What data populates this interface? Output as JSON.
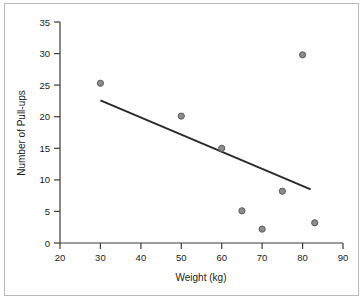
{
  "chart_data": {
    "type": "scatter",
    "title": "",
    "xlabel": "Weight (kg)",
    "ylabel": "Number of Pull-ups",
    "xlim": [
      20,
      90
    ],
    "ylim": [
      0,
      35
    ],
    "xticks": [
      20,
      30,
      40,
      50,
      60,
      70,
      80,
      90
    ],
    "yticks": [
      0,
      5,
      10,
      15,
      20,
      25,
      30,
      35
    ],
    "xtick_labels": [
      "20",
      "30",
      "40",
      "50",
      "60",
      "70",
      "80",
      "90"
    ],
    "ytick_labels": [
      "0",
      "5",
      "10",
      "15",
      "20",
      "25",
      "30",
      "35"
    ],
    "grid": false,
    "legend": null,
    "marker_color": "#8c8c8c",
    "marker_edge_color": "#5a5a5a",
    "line_color": "#2b2b2b",
    "points": [
      {
        "x": 30,
        "y": 25.3
      },
      {
        "x": 50,
        "y": 20.1
      },
      {
        "x": 60,
        "y": 15.0
      },
      {
        "x": 65,
        "y": 5.1
      },
      {
        "x": 70,
        "y": 2.2
      },
      {
        "x": 75,
        "y": 8.2
      },
      {
        "x": 80,
        "y": 29.8
      },
      {
        "x": 83,
        "y": 3.2
      }
    ],
    "series": [
      {
        "name": "Pull-ups vs Weight",
        "x": [
          30,
          50,
          60,
          65,
          70,
          75,
          80,
          83
        ],
        "values": [
          25.3,
          20.1,
          15.0,
          5.1,
          2.2,
          8.2,
          29.8,
          3.2
        ]
      }
    ],
    "trend_line": {
      "type": "line",
      "x_start": 30,
      "y_start": 22.6,
      "x_end": 82,
      "y_end": 8.5
    }
  }
}
